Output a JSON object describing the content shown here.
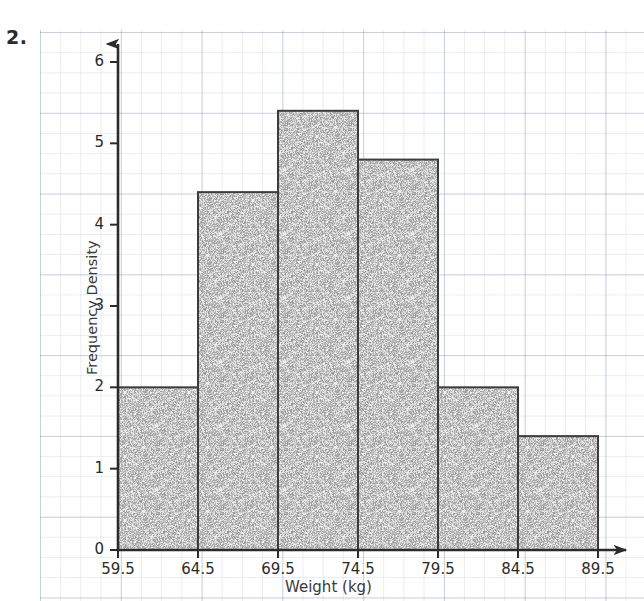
{
  "question_number": "2.",
  "chart_data": {
    "type": "bar",
    "subtype": "histogram",
    "title": "",
    "xlabel": "Weight (kg)",
    "ylabel": "Frequency Density",
    "xlim": [
      59.5,
      89.5
    ],
    "ylim": [
      0,
      6.4
    ],
    "grid": true,
    "legend": null,
    "x_ticks": [
      "59.5",
      "64.5",
      "69.5",
      "74.5",
      "79.5",
      "84.5",
      "89.5"
    ],
    "x_tick_values": [
      59.5,
      64.5,
      69.5,
      74.5,
      79.5,
      84.5,
      89.5
    ],
    "y_ticks": [
      "0",
      "1",
      "2",
      "3",
      "4",
      "5",
      "6"
    ],
    "y_tick_values": [
      0,
      1,
      2,
      3,
      4,
      5,
      6
    ],
    "bin_edges": [
      59.5,
      64.5,
      69.5,
      74.5,
      79.5,
      84.5,
      89.5
    ],
    "categories": [
      "59.5-64.5",
      "64.5-69.5",
      "69.5-74.5",
      "74.5-79.5",
      "79.5-84.5",
      "84.5-89.5"
    ],
    "values": [
      2.0,
      4.4,
      5.4,
      4.8,
      2.0,
      1.4
    ],
    "bar_fill_color": "#b9b9b9",
    "bar_edge_color": "#3c3c3c",
    "axis_color": "#2b2b2b",
    "grid_color": "#8b9bb5"
  }
}
